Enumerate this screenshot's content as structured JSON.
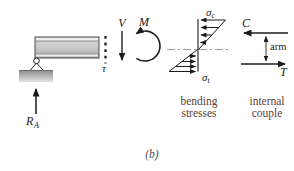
{
  "figure": {
    "label": "(b)"
  },
  "left_beam": {
    "reaction_label": {
      "base": "R",
      "sub": "A"
    },
    "shear_stress_label": "τ"
  },
  "resultants": {
    "shear_label": "V",
    "moment_label": "M"
  },
  "bending_diagram": {
    "top_stress": {
      "base": "σ",
      "sub": "c"
    },
    "bottom_stress": {
      "base": "σ",
      "sub": "t"
    },
    "caption": {
      "line1": "bending",
      "line2": "stresses"
    }
  },
  "couple_diagram": {
    "compression_label": "C",
    "tension_label": "T",
    "arm_label": "arm",
    "caption": {
      "line1": "internal",
      "line2": "couple"
    }
  },
  "colors": {
    "ink": "#1c1c1c",
    "caption_text": "#5d4037",
    "neutral_axis": "#9b9b9b"
  }
}
